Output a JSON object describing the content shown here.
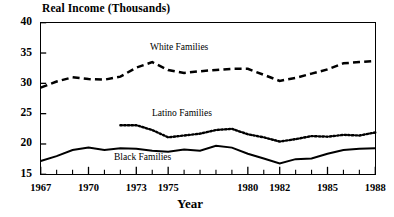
{
  "chart_data": {
    "type": "line",
    "title": "Real Income (Thousands)",
    "xlabel": "Year",
    "ylabel": "Real Income (Thousands)",
    "xlim": [
      1967,
      1988
    ],
    "ylim": [
      15,
      40
    ],
    "ytick_labels": [
      "40",
      "35",
      "30",
      "25",
      "20",
      "15"
    ],
    "ytick_values": [
      40,
      35,
      30,
      25,
      20,
      15
    ],
    "xtick_labels": [
      "1967",
      "1970",
      "1973",
      "1975",
      "1980",
      "1982",
      "1985",
      "1988"
    ],
    "xtick_values": [
      1967,
      1970,
      1973,
      1975,
      1980,
      1982,
      1985,
      1988
    ],
    "minor_xticks": [
      1968,
      1969,
      1971,
      1972,
      1974,
      1976,
      1977,
      1978,
      1979,
      1981,
      1983,
      1984,
      1986,
      1987
    ],
    "grid": false,
    "legend_position": "inline-annotations",
    "x": [
      1967,
      1968,
      1969,
      1970,
      1971,
      1972,
      1973,
      1974,
      1975,
      1976,
      1977,
      1978,
      1979,
      1980,
      1981,
      1982,
      1983,
      1984,
      1985,
      1986,
      1987,
      1988
    ],
    "series": [
      {
        "name": "White Families",
        "style": "dashed",
        "color": "#000000",
        "x": [
          1967,
          1968,
          1969,
          1970,
          1971,
          1972,
          1973,
          1974,
          1975,
          1976,
          1977,
          1978,
          1979,
          1980,
          1981,
          1982,
          1983,
          1984,
          1985,
          1986,
          1987,
          1988
        ],
        "values": [
          29.3,
          30.3,
          31.0,
          30.7,
          30.6,
          31.1,
          32.6,
          33.5,
          32.2,
          31.7,
          32.0,
          32.2,
          32.4,
          32.4,
          31.4,
          30.4,
          30.9,
          31.6,
          32.3,
          33.3,
          33.5,
          33.7
        ]
      },
      {
        "name": "Latino Families",
        "style": "dotted",
        "color": "#000000",
        "x": [
          1972,
          1973,
          1974,
          1975,
          1976,
          1977,
          1978,
          1979,
          1980,
          1981,
          1982,
          1983,
          1984,
          1985,
          1986,
          1987,
          1988
        ],
        "values": [
          23.1,
          23.1,
          22.3,
          21.1,
          21.4,
          21.7,
          22.3,
          22.5,
          21.6,
          21.1,
          20.4,
          20.8,
          21.3,
          21.2,
          21.5,
          21.4,
          21.9
        ]
      },
      {
        "name": "Black Families",
        "style": "solid",
        "color": "#000000",
        "x": [
          1967,
          1968,
          1969,
          1970,
          1971,
          1972,
          1973,
          1974,
          1975,
          1976,
          1977,
          1978,
          1979,
          1980,
          1981,
          1982,
          1983,
          1984,
          1985,
          1986,
          1987,
          1988
        ],
        "values": [
          17.2,
          18.0,
          19.0,
          19.4,
          19.0,
          19.3,
          19.2,
          18.9,
          18.7,
          19.1,
          18.9,
          19.7,
          19.4,
          18.4,
          17.6,
          16.8,
          17.5,
          17.6,
          18.4,
          19.0,
          19.2,
          19.3
        ]
      }
    ]
  },
  "annotations": {
    "white_label": "White Families",
    "latino_label": "Latino Families",
    "black_label": "Black Families"
  }
}
